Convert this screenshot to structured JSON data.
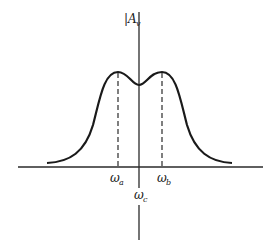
{
  "diagram": {
    "type": "frequency-response-curve",
    "y_axis_label": "|A_v|",
    "y_axis_label_main": "A",
    "y_axis_label_sub": "v",
    "x_markers": [
      {
        "main": "ω",
        "sub": "a",
        "role": "left-peak"
      },
      {
        "main": "ω",
        "sub": "c",
        "role": "center"
      },
      {
        "main": "ω",
        "sub": "b",
        "role": "right-peak"
      }
    ],
    "colors": {
      "line": "#1a1a1a",
      "background": "#ffffff"
    }
  }
}
